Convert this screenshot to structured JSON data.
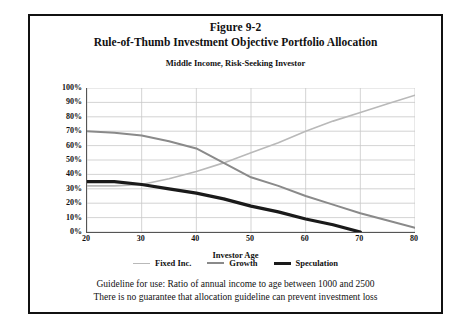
{
  "figure": {
    "number": "Figure 9-2",
    "title": "Rule-of-Thumb Investment Objective Portfolio Allocation",
    "subtitle": "Middle Income, Risk-Seeking Investor"
  },
  "footer": {
    "line1": "Guideline for use: Ratio of annual income to age between 1000 and 2500",
    "line2": "There is no guarantee that allocation guideline can prevent investment loss"
  },
  "colors": {
    "fixed_inc": "#b9b9b9",
    "growth": "#8a8a8a",
    "speculation": "#1a1a1a",
    "grid": "#c8c8c8",
    "axis": "#555555",
    "frame": "#111111"
  },
  "chart_data": {
    "type": "line",
    "title": "Rule-of-Thumb Investment Objective Portfolio Allocation",
    "subtitle": "Middle Income, Risk-Seeking Investor",
    "xlabel": "Investor Age",
    "ylabel": "",
    "xlim": [
      20,
      80
    ],
    "ylim": [
      0,
      100
    ],
    "xticks": [
      20,
      30,
      40,
      50,
      60,
      70,
      80
    ],
    "yticks": [
      0,
      10,
      20,
      30,
      40,
      50,
      60,
      70,
      80,
      90,
      100
    ],
    "ytick_labels": [
      "0%",
      "10%",
      "20%",
      "30%",
      "40%",
      "50%",
      "60%",
      "70%",
      "80%",
      "90%",
      "100%"
    ],
    "xtick_labels": [
      "20",
      "30",
      "40",
      "50",
      "60",
      "70",
      "80"
    ],
    "grid": true,
    "legend_position": "bottom",
    "x": [
      20,
      25,
      30,
      35,
      40,
      45,
      50,
      55,
      60,
      65,
      70,
      75,
      80
    ],
    "series": [
      {
        "name": "Fixed Inc.",
        "color": "#b9b9b9",
        "width": 1.6,
        "x": [
          20,
          25,
          30,
          35,
          40,
          45,
          50,
          55,
          60,
          65,
          70,
          75,
          80
        ],
        "values": [
          32,
          32,
          33,
          37,
          42,
          48,
          55,
          62,
          70,
          77,
          83,
          89,
          95
        ]
      },
      {
        "name": "Growth",
        "color": "#8a8a8a",
        "width": 2.0,
        "x": [
          20,
          25,
          30,
          35,
          40,
          45,
          50,
          55,
          60,
          65,
          70,
          75,
          80
        ],
        "values": [
          70,
          69,
          67,
          63,
          58,
          48,
          38,
          32,
          25,
          19,
          13,
          8,
          3
        ]
      },
      {
        "name": "Speculation",
        "color": "#1a1a1a",
        "width": 3.2,
        "x": [
          20,
          25,
          30,
          35,
          40,
          45,
          50,
          55,
          60,
          65,
          70
        ],
        "values": [
          35,
          35,
          33,
          30,
          27,
          23,
          18,
          14,
          9,
          5,
          0
        ]
      }
    ]
  }
}
